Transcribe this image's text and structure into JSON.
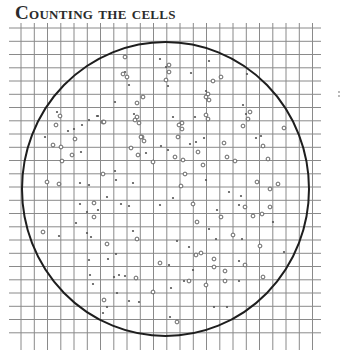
{
  "title": "Counting the cells",
  "colors": {
    "grid": "#8a8a8a",
    "circle": "#1e1e1e",
    "dots": "#555555",
    "title": "#2b2b2b",
    "background": "#ffffff"
  },
  "grid": {
    "x_start": 9,
    "x_end": 321,
    "y_start": 15,
    "y_end": 350,
    "first_vertical": 21,
    "last_vertical": 320,
    "first_horizontal": 28,
    "last_horizontal": 345,
    "spacing": 13.25
  },
  "dish": {
    "cx": 165.5,
    "cy": 189,
    "rx": 143.5,
    "ry": 147
  },
  "cells": [
    [
      125,
      57,
      1
    ],
    [
      160,
      59,
      0
    ],
    [
      169,
      65,
      1
    ],
    [
      166,
      67,
      0
    ],
    [
      169,
      72,
      1
    ],
    [
      125,
      72,
      0
    ],
    [
      123,
      74,
      1
    ],
    [
      127,
      77,
      1
    ],
    [
      129,
      85,
      0
    ],
    [
      166,
      80,
      1
    ],
    [
      168,
      86,
      0
    ],
    [
      191,
      73,
      0
    ],
    [
      209,
      61,
      0
    ],
    [
      221,
      77,
      1
    ],
    [
      213,
      81,
      1
    ],
    [
      206,
      91,
      0
    ],
    [
      208,
      94,
      1
    ],
    [
      206,
      97,
      1
    ],
    [
      209,
      100,
      1
    ],
    [
      247,
      74,
      0
    ],
    [
      143,
      97,
      1
    ],
    [
      137,
      103,
      1
    ],
    [
      115,
      102,
      0
    ],
    [
      243,
      105,
      0
    ],
    [
      246,
      114,
      0
    ],
    [
      250,
      112,
      1
    ],
    [
      248,
      119,
      1
    ],
    [
      134,
      114,
      0
    ],
    [
      137,
      117,
      1
    ],
    [
      135,
      120,
      1
    ],
    [
      139,
      123,
      1
    ],
    [
      98,
      116,
      0
    ],
    [
      103,
      122,
      1
    ],
    [
      97,
      116,
      0
    ],
    [
      173,
      117,
      0
    ],
    [
      182,
      123,
      1
    ],
    [
      179,
      125,
      1
    ],
    [
      182,
      129,
      1
    ],
    [
      195,
      117,
      0
    ],
    [
      206,
      115,
      1
    ],
    [
      208,
      119,
      1
    ],
    [
      243,
      126,
      1
    ],
    [
      142,
      137,
      1
    ],
    [
      178,
      137,
      1
    ],
    [
      204,
      138,
      0
    ],
    [
      256,
      138,
      0
    ],
    [
      261,
      136,
      0
    ],
    [
      284,
      128,
      1
    ],
    [
      263,
      146,
      1
    ],
    [
      57,
      112,
      0
    ],
    [
      60,
      116,
      1
    ],
    [
      56,
      125,
      1
    ],
    [
      68,
      131,
      0
    ],
    [
      74,
      129,
      0
    ],
    [
      82,
      125,
      0
    ],
    [
      89,
      120,
      0
    ],
    [
      104,
      122,
      1
    ],
    [
      45,
      137,
      0
    ],
    [
      53,
      145,
      1
    ],
    [
      61,
      147,
      1
    ],
    [
      75,
      139,
      1
    ],
    [
      72,
      155,
      1
    ],
    [
      81,
      152,
      0
    ],
    [
      62,
      161,
      1
    ],
    [
      131,
      148,
      1
    ],
    [
      141,
      137,
      1
    ],
    [
      144,
      141,
      1
    ],
    [
      138,
      155,
      1
    ],
    [
      146,
      153,
      0
    ],
    [
      153,
      162,
      1
    ],
    [
      161,
      146,
      0
    ],
    [
      168,
      150,
      0
    ],
    [
      175,
      157,
      1
    ],
    [
      183,
      160,
      1
    ],
    [
      190,
      144,
      0
    ],
    [
      196,
      142,
      0
    ],
    [
      198,
      152,
      1
    ],
    [
      203,
      165,
      1
    ],
    [
      185,
      174,
      1
    ],
    [
      224,
      143,
      1
    ],
    [
      227,
      157,
      1
    ],
    [
      235,
      161,
      1
    ],
    [
      268,
      159,
      1
    ],
    [
      103,
      174,
      1
    ],
    [
      115,
      171,
      0
    ],
    [
      116,
      180,
      0
    ],
    [
      133,
      183,
      0
    ],
    [
      47,
      182,
      1
    ],
    [
      59,
      184,
      1
    ],
    [
      80,
      183,
      0
    ],
    [
      89,
      185,
      0
    ],
    [
      206,
      180,
      0
    ],
    [
      181,
      186,
      1
    ],
    [
      257,
      182,
      1
    ],
    [
      278,
      184,
      1
    ],
    [
      270,
      189,
      1
    ],
    [
      107,
      197,
      0
    ],
    [
      94,
      203,
      1
    ],
    [
      80,
      204,
      0
    ],
    [
      121,
      204,
      0
    ],
    [
      129,
      206,
      0
    ],
    [
      173,
      198,
      0
    ],
    [
      160,
      205,
      0
    ],
    [
      193,
      204,
      1
    ],
    [
      229,
      192,
      0
    ],
    [
      241,
      196,
      0
    ],
    [
      239,
      205,
      0
    ],
    [
      245,
      207,
      1
    ],
    [
      270,
      207,
      1
    ],
    [
      87,
      212,
      0
    ],
    [
      98,
      210,
      0
    ],
    [
      94,
      217,
      1
    ],
    [
      217,
      210,
      0
    ],
    [
      221,
      217,
      1
    ],
    [
      253,
      216,
      1
    ],
    [
      262,
      214,
      1
    ],
    [
      43,
      232,
      1
    ],
    [
      59,
      236,
      0
    ],
    [
      76,
      223,
      0
    ],
    [
      87,
      233,
      0
    ],
    [
      91,
      237,
      0
    ],
    [
      107,
      244,
      1
    ],
    [
      133,
      231,
      0
    ],
    [
      137,
      239,
      1
    ],
    [
      197,
      222,
      1
    ],
    [
      209,
      229,
      0
    ],
    [
      177,
      241,
      0
    ],
    [
      189,
      247,
      0
    ],
    [
      196,
      255,
      1
    ],
    [
      201,
      253,
      1
    ],
    [
      216,
      239,
      0
    ],
    [
      233,
      235,
      1
    ],
    [
      242,
      239,
      0
    ],
    [
      260,
      246,
      1
    ],
    [
      273,
      222,
      0
    ],
    [
      284,
      252,
      0
    ],
    [
      116,
      254,
      0
    ],
    [
      89,
      260,
      0
    ],
    [
      108,
      259,
      0
    ],
    [
      160,
      263,
      1
    ],
    [
      169,
      265,
      0
    ],
    [
      214,
      259,
      1
    ],
    [
      214,
      267,
      1
    ],
    [
      193,
      270,
      0
    ],
    [
      225,
      271,
      1
    ],
    [
      239,
      261,
      0
    ],
    [
      245,
      265,
      1
    ],
    [
      263,
      277,
      1
    ],
    [
      90,
      275,
      0
    ],
    [
      93,
      284,
      0
    ],
    [
      114,
      277,
      0
    ],
    [
      119,
      275,
      0
    ],
    [
      125,
      276,
      0
    ],
    [
      136,
      278,
      1
    ],
    [
      184,
      281,
      0
    ],
    [
      189,
      281,
      1
    ],
    [
      206,
      285,
      1
    ],
    [
      225,
      281,
      1
    ],
    [
      239,
      281,
      0
    ],
    [
      117,
      293,
      0
    ],
    [
      104,
      300,
      1
    ],
    [
      107,
      307,
      0
    ],
    [
      103,
      313,
      0
    ],
    [
      129,
      301,
      0
    ],
    [
      139,
      302,
      0
    ],
    [
      153,
      292,
      1
    ],
    [
      171,
      288,
      0
    ],
    [
      214,
      307,
      0
    ],
    [
      227,
      307,
      0
    ],
    [
      170,
      317,
      0
    ],
    [
      177,
      322,
      1
    ]
  ],
  "edge_fragment": {
    "x": 339,
    "y": 92,
    "label": "fragment"
  }
}
